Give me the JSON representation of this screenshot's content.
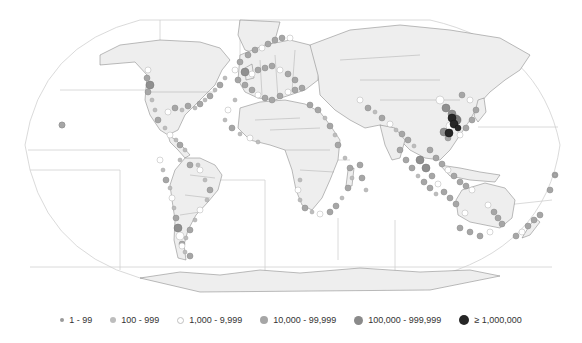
{
  "map": {
    "projection": "robinson",
    "background": "#ffffff",
    "land_fill": "#eeeeee",
    "border_color": "#7a7a7a",
    "graticule_color": "#c8c8c8",
    "ocean_zone_lines_color": "#d0d0d0"
  },
  "legend": {
    "items": [
      {
        "label": "1 - 99",
        "size": 3,
        "fill": "#9a9a9a",
        "stroke": "#bdbdbd"
      },
      {
        "label": "100 - 999",
        "size": 6,
        "fill": "#bdbdbd",
        "stroke": "#a8a8a8"
      },
      {
        "label": "1,000 - 9,999",
        "size": 7,
        "fill": "#ffffff",
        "stroke": "#b8b8b8"
      },
      {
        "label": "10,000 - 99,999",
        "size": 8,
        "fill": "#a6a6a6",
        "stroke": "#939393"
      },
      {
        "label": "100,000 - 999,999",
        "size": 9,
        "fill": "#8a8a8a",
        "stroke": "#7a7a7a"
      },
      {
        "label": "≥ 1,000,000",
        "size": 10,
        "fill": "#262626",
        "stroke": "#1a1a1a"
      }
    ]
  },
  "points": [
    [
      148,
      70,
      3
    ],
    [
      147,
      78,
      3
    ],
    [
      150,
      85,
      4
    ],
    [
      148,
      92,
      3
    ],
    [
      152,
      100,
      2
    ],
    [
      155,
      110,
      2
    ],
    [
      158,
      120,
      3
    ],
    [
      165,
      128,
      2
    ],
    [
      170,
      135,
      3
    ],
    [
      176,
      140,
      2
    ],
    [
      180,
      145,
      3
    ],
    [
      185,
      150,
      2
    ],
    [
      168,
      112,
      3
    ],
    [
      175,
      108,
      3
    ],
    [
      182,
      110,
      2
    ],
    [
      188,
      106,
      3
    ],
    [
      195,
      108,
      2
    ],
    [
      200,
      104,
      3
    ],
    [
      205,
      100,
      2
    ],
    [
      210,
      96,
      3
    ],
    [
      215,
      90,
      2
    ],
    [
      220,
      85,
      3
    ],
    [
      225,
      78,
      2
    ],
    [
      62,
      125,
      3
    ],
    [
      160,
      160,
      3
    ],
    [
      163,
      170,
      2
    ],
    [
      166,
      180,
      3
    ],
    [
      170,
      188,
      2
    ],
    [
      172,
      198,
      3
    ],
    [
      174,
      208,
      2
    ],
    [
      176,
      218,
      3
    ],
    [
      178,
      228,
      4
    ],
    [
      180,
      236,
      4
    ],
    [
      182,
      244,
      3
    ],
    [
      185,
      252,
      2
    ],
    [
      190,
      256,
      3
    ],
    [
      200,
      170,
      3
    ],
    [
      205,
      180,
      2
    ],
    [
      210,
      190,
      3
    ],
    [
      207,
      200,
      2
    ],
    [
      200,
      210,
      3
    ],
    [
      195,
      220,
      2
    ],
    [
      190,
      230,
      3
    ],
    [
      186,
      238,
      2
    ],
    [
      182,
      246,
      3
    ],
    [
      198,
      165,
      2
    ],
    [
      190,
      165,
      3
    ],
    [
      180,
      160,
      2
    ],
    [
      235,
      70,
      3
    ],
    [
      240,
      62,
      3
    ],
    [
      248,
      55,
      3
    ],
    [
      255,
      50,
      3
    ],
    [
      262,
      48,
      3
    ],
    [
      268,
      44,
      3
    ],
    [
      275,
      40,
      3
    ],
    [
      282,
      38,
      3
    ],
    [
      290,
      38,
      3
    ],
    [
      238,
      80,
      3
    ],
    [
      245,
      85,
      3
    ],
    [
      252,
      90,
      3
    ],
    [
      258,
      95,
      3
    ],
    [
      265,
      98,
      3
    ],
    [
      272,
      100,
      3
    ],
    [
      280,
      96,
      3
    ],
    [
      288,
      92,
      3
    ],
    [
      295,
      90,
      3
    ],
    [
      302,
      88,
      3
    ],
    [
      245,
      72,
      4
    ],
    [
      252,
      74,
      3
    ],
    [
      258,
      70,
      3
    ],
    [
      265,
      68,
      3
    ],
    [
      272,
      66,
      3
    ],
    [
      280,
      70,
      3
    ],
    [
      288,
      74,
      3
    ],
    [
      295,
      80,
      3
    ],
    [
      235,
      100,
      2
    ],
    [
      228,
      110,
      3
    ],
    [
      225,
      120,
      2
    ],
    [
      232,
      128,
      3
    ],
    [
      240,
      134,
      2
    ],
    [
      250,
      138,
      3
    ],
    [
      258,
      142,
      2
    ],
    [
      310,
      105,
      3
    ],
    [
      318,
      110,
      3
    ],
    [
      325,
      118,
      2
    ],
    [
      330,
      126,
      3
    ],
    [
      335,
      135,
      2
    ],
    [
      338,
      145,
      3
    ],
    [
      345,
      158,
      2
    ],
    [
      350,
      168,
      3
    ],
    [
      352,
      178,
      2
    ],
    [
      348,
      188,
      3
    ],
    [
      342,
      198,
      2
    ],
    [
      336,
      206,
      3
    ],
    [
      330,
      212,
      3
    ],
    [
      300,
      180,
      2
    ],
    [
      298,
      190,
      3
    ],
    [
      300,
      200,
      2
    ],
    [
      305,
      208,
      3
    ],
    [
      312,
      212,
      2
    ],
    [
      320,
      214,
      3
    ],
    [
      360,
      165,
      3
    ],
    [
      362,
      178,
      3
    ],
    [
      366,
      190,
      2
    ],
    [
      360,
      100,
      3
    ],
    [
      368,
      108,
      3
    ],
    [
      375,
      112,
      2
    ],
    [
      382,
      118,
      3
    ],
    [
      390,
      124,
      3
    ],
    [
      396,
      130,
      2
    ],
    [
      402,
      134,
      3
    ],
    [
      408,
      140,
      3
    ],
    [
      414,
      146,
      2
    ],
    [
      400,
      150,
      3
    ],
    [
      406,
      160,
      3
    ],
    [
      412,
      168,
      3
    ],
    [
      418,
      176,
      2
    ],
    [
      424,
      182,
      3
    ],
    [
      430,
      188,
      3
    ],
    [
      436,
      194,
      2
    ],
    [
      440,
      100,
      4
    ],
    [
      446,
      108,
      4
    ],
    [
      452,
      114,
      4
    ],
    [
      456,
      120,
      5
    ],
    [
      450,
      126,
      4
    ],
    [
      444,
      132,
      4
    ],
    [
      448,
      138,
      3
    ],
    [
      462,
      95,
      3
    ],
    [
      470,
      100,
      3
    ],
    [
      476,
      110,
      3
    ],
    [
      472,
      120,
      3
    ],
    [
      466,
      128,
      3
    ],
    [
      460,
      135,
      3
    ],
    [
      430,
      150,
      3
    ],
    [
      436,
      158,
      3
    ],
    [
      442,
      164,
      3
    ],
    [
      448,
      170,
      3
    ],
    [
      454,
      176,
      3
    ],
    [
      460,
      182,
      3
    ],
    [
      466,
      186,
      3
    ],
    [
      472,
      190,
      3
    ],
    [
      420,
      160,
      4
    ],
    [
      426,
      168,
      4
    ],
    [
      432,
      176,
      3
    ],
    [
      438,
      184,
      3
    ],
    [
      444,
      192,
      3
    ],
    [
      450,
      198,
      3
    ],
    [
      456,
      204,
      3
    ],
    [
      488,
      205,
      3
    ],
    [
      494,
      212,
      3
    ],
    [
      498,
      218,
      3
    ],
    [
      502,
      224,
      3
    ],
    [
      490,
      232,
      3
    ],
    [
      480,
      236,
      3
    ],
    [
      470,
      232,
      3
    ],
    [
      460,
      228,
      3
    ],
    [
      465,
      213,
      3
    ],
    [
      540,
      215,
      3
    ],
    [
      534,
      220,
      3
    ],
    [
      528,
      226,
      3
    ],
    [
      522,
      232,
      3
    ],
    [
      516,
      236,
      3
    ],
    [
      550,
      190,
      3
    ],
    [
      555,
      175,
      3
    ]
  ],
  "dark_points": [
    [
      452,
      118,
      4
    ],
    [
      454,
      124,
      4
    ],
    [
      458,
      128,
      3
    ],
    [
      449,
      133,
      4
    ]
  ]
}
